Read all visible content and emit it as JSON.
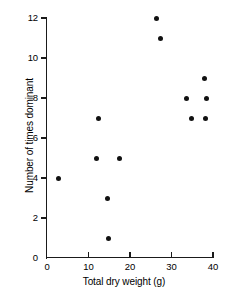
{
  "chart_data": {
    "type": "scatter",
    "title": "",
    "xlabel": "Total dry weight (g)",
    "ylabel": "Number of times dominant",
    "xlim": [
      0,
      40
    ],
    "ylim": [
      0,
      12
    ],
    "xticks": [
      0,
      10,
      20,
      30,
      40
    ],
    "yticks": [
      0,
      2,
      4,
      6,
      8,
      10,
      12
    ],
    "xtick_labels": [
      "0",
      "10",
      "20",
      "30",
      "40"
    ],
    "ytick_labels": [
      "0",
      "2",
      "4",
      "6",
      "8",
      "10",
      "12"
    ],
    "grid": false,
    "legend": null,
    "marker": "filled-circle",
    "marker_color": "#111111",
    "points": [
      {
        "x": 2.7,
        "y": 4
      },
      {
        "x": 12.3,
        "y": 7
      },
      {
        "x": 12.0,
        "y": 5
      },
      {
        "x": 17.4,
        "y": 5
      },
      {
        "x": 14.5,
        "y": 3
      },
      {
        "x": 14.8,
        "y": 1
      },
      {
        "x": 26.4,
        "y": 12
      },
      {
        "x": 27.3,
        "y": 11
      },
      {
        "x": 33.5,
        "y": 8
      },
      {
        "x": 34.8,
        "y": 7
      },
      {
        "x": 38.0,
        "y": 9
      },
      {
        "x": 38.5,
        "y": 8
      },
      {
        "x": 38.2,
        "y": 7
      }
    ]
  },
  "axes": {
    "x_title": "Total dry weight (g)",
    "y_title": "Number of times dominant"
  }
}
